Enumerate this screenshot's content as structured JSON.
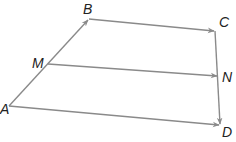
{
  "diagram": {
    "type": "vector-quadrilateral",
    "line_color": "#8a8a8a",
    "label_color": "#222222",
    "points": {
      "A": {
        "label": "A",
        "x": 9,
        "y": 106,
        "lx": 0,
        "ly": 114
      },
      "B": {
        "label": "B",
        "x": 89,
        "y": 19,
        "lx": 83,
        "ly": 14
      },
      "C": {
        "label": "C",
        "x": 215,
        "y": 31,
        "lx": 219,
        "ly": 27
      },
      "M": {
        "label": "M",
        "x": 48,
        "y": 64,
        "lx": 32,
        "ly": 68
      },
      "N": {
        "label": "N",
        "x": 218,
        "y": 76,
        "lx": 222,
        "ly": 82
      },
      "D": {
        "label": "D",
        "x": 220,
        "y": 125,
        "lx": 222,
        "ly": 137
      }
    },
    "vectors": [
      {
        "from": "A",
        "to": "B"
      },
      {
        "from": "B",
        "to": "C"
      },
      {
        "from": "M",
        "to": "N"
      },
      {
        "from": "C",
        "to": "D"
      },
      {
        "from": "A",
        "to": "D"
      }
    ]
  }
}
